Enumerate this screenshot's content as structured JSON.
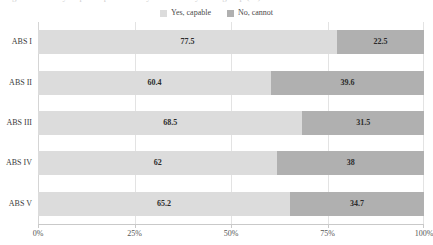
{
  "title_remnant": "Figure 3. Ability to participate in daily activities by ABS group (%)",
  "legend": {
    "position": "top-center",
    "items": [
      {
        "label": "Yes, capable",
        "color": "#dcdcdc",
        "swatch_icon": "legend-swatch-square"
      },
      {
        "label": "No, cannot",
        "color": "#b0b0b0",
        "swatch_icon": "legend-swatch-square"
      }
    ]
  },
  "axes": {
    "x_ticks": [
      "0%",
      "25%",
      "50%",
      "75%",
      "100%"
    ],
    "x_tick_values": [
      0,
      25,
      50,
      75,
      100
    ],
    "y_categories": [
      "ABS I",
      "ABS II",
      "ABS III",
      "ABS IV",
      "ABS V"
    ]
  },
  "colors": {
    "yes": "#dcdcdc",
    "no": "#b0b0b0",
    "grid": "#e3e3e3",
    "axis": "#c9c9c9",
    "text": "#3a3a3a",
    "label_text": "#2b2b2b",
    "background": "#ffffff"
  },
  "chart_data": {
    "type": "bar",
    "orientation": "horizontal",
    "stacked": true,
    "normalized_percent": true,
    "title": "",
    "xlabel": "",
    "ylabel": "",
    "xlim": [
      0,
      100
    ],
    "grid": true,
    "legend_position": "top-center",
    "categories": [
      "ABS I",
      "ABS II",
      "ABS III",
      "ABS IV",
      "ABS V"
    ],
    "series": [
      {
        "name": "Yes, capable",
        "color": "#dcdcdc",
        "values": [
          77.5,
          60.4,
          68.5,
          62,
          65.2
        ],
        "labels": [
          "77.5",
          "60.4",
          "68.5",
          "62",
          "65.2"
        ]
      },
      {
        "name": "No, cannot",
        "color": "#b0b0b0",
        "values": [
          22.5,
          39.6,
          31.5,
          38,
          34.7
        ],
        "labels": [
          "22.5",
          "39.6",
          "31.5",
          "38",
          "34.7"
        ]
      }
    ]
  }
}
